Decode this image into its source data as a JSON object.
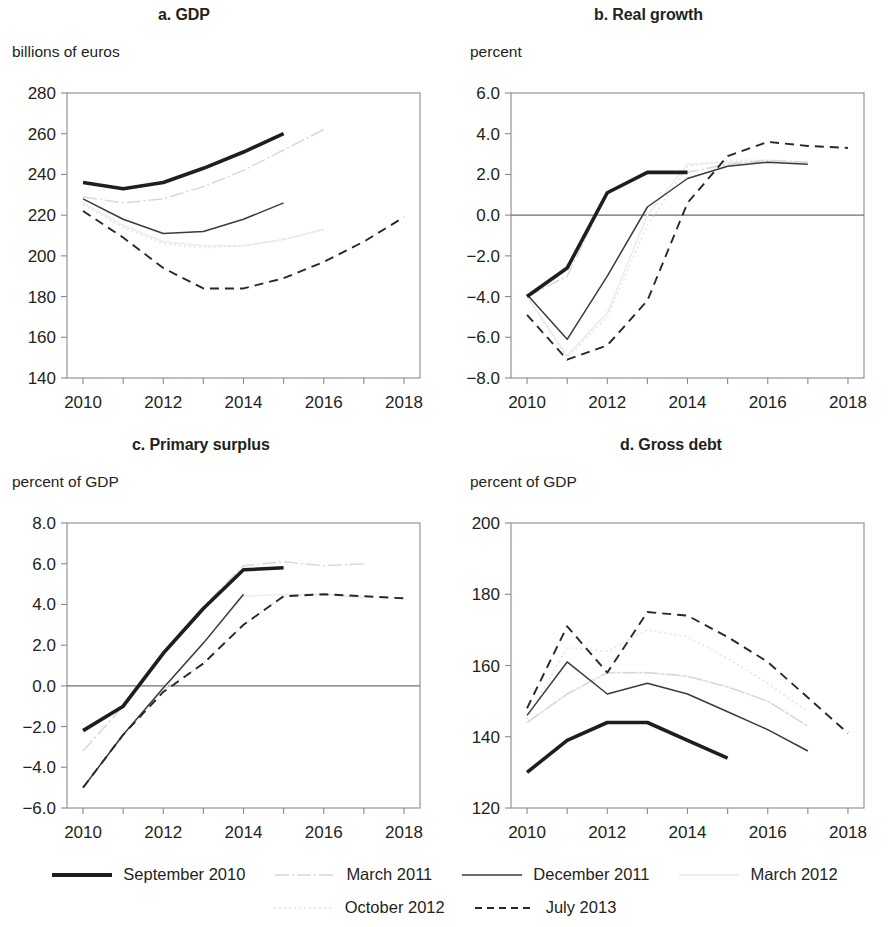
{
  "figure": {
    "panels": [
      {
        "id": "a",
        "title": "a. GDP",
        "unit": "billions of euros"
      },
      {
        "id": "b",
        "title": "b. Real growth",
        "unit": "percent"
      },
      {
        "id": "c",
        "title": "c. Primary surplus",
        "unit": "percent of GDP"
      },
      {
        "id": "d",
        "title": "d. Gross debt",
        "unit": "percent of GDP"
      }
    ]
  },
  "legend": {
    "rows": [
      [
        {
          "label": "September 2010",
          "style": "thick-solid-black",
          "color": "#201d1d"
        },
        {
          "label": "March 2011",
          "style": "light-dash-dot",
          "color": "#d8d8d8"
        },
        {
          "label": "December 2011",
          "style": "thin-solid-gray",
          "color": "#3b3b3b"
        },
        {
          "label": "March 2012",
          "style": "very-light-solid",
          "color": "#ededed"
        }
      ],
      [
        {
          "label": "October 2012",
          "style": "very-light-dotted",
          "color": "#e4e4e4"
        },
        {
          "label": "July 2013",
          "style": "black-dashed",
          "color": "#2a2727"
        }
      ]
    ]
  },
  "chart_data": [
    {
      "type": "line",
      "panel": "a",
      "title": "a. GDP",
      "xlabel": "",
      "ylabel": "billions of euros",
      "ylim": [
        140,
        280
      ],
      "yticks": [
        "140",
        "160",
        "180",
        "200",
        "220",
        "240",
        "260",
        "280"
      ],
      "xlim": [
        2009.6,
        2018.4
      ],
      "xticks": [
        "2010",
        "2011",
        "2012",
        "2013",
        "2014",
        "2015",
        "2016",
        "2017",
        "2018"
      ],
      "xtick_labels_shown": [
        "2010",
        "2012",
        "2014",
        "2016",
        "2018"
      ],
      "grid": false,
      "legend_position": "below figure",
      "series": [
        {
          "name": "September 2010",
          "x": [
            2010,
            2011,
            2012,
            2013,
            2014,
            2015
          ],
          "values": [
            236,
            233,
            236,
            243,
            251,
            260
          ]
        },
        {
          "name": "March 2011",
          "x": [
            2010,
            2011,
            2012,
            2013,
            2014,
            2015,
            2016
          ],
          "values": [
            229,
            226,
            228,
            234,
            242,
            252,
            262
          ]
        },
        {
          "name": "December 2011",
          "x": [
            2010,
            2011,
            2012,
            2013,
            2014,
            2015
          ],
          "values": [
            228,
            218,
            211,
            212,
            218,
            226
          ]
        },
        {
          "name": "March 2012",
          "x": [
            2010,
            2011,
            2012,
            2013,
            2014,
            2015,
            2016
          ],
          "values": [
            226,
            215,
            207,
            205,
            205,
            208,
            213
          ]
        },
        {
          "name": "October 2012",
          "x": [
            2010,
            2011,
            2012,
            2013,
            2014,
            2015,
            2016
          ],
          "values": [
            225,
            214,
            206,
            204,
            205,
            208,
            213
          ]
        },
        {
          "name": "July 2013",
          "x": [
            2010,
            2011,
            2012,
            2013,
            2014,
            2015,
            2016,
            2017,
            2018
          ],
          "values": [
            222,
            209,
            194,
            184,
            184,
            189,
            197,
            207,
            219
          ]
        }
      ]
    },
    {
      "type": "line",
      "panel": "b",
      "title": "b. Real growth",
      "xlabel": "",
      "ylabel": "percent",
      "ylim": [
        -8.0,
        6.0
      ],
      "yticks": [
        "-8.0",
        "-6.0",
        "-4.0",
        "-2.0",
        "0.0",
        "2.0",
        "4.0",
        "6.0"
      ],
      "xlim": [
        2009.6,
        2018.4
      ],
      "xticks": [
        "2010",
        "2011",
        "2012",
        "2013",
        "2014",
        "2015",
        "2016",
        "2017",
        "2018"
      ],
      "xtick_labels_shown": [
        "2010",
        "2012",
        "2014",
        "2016",
        "2018"
      ],
      "grid": false,
      "zero_line": 0.0,
      "legend_position": "below figure",
      "series": [
        {
          "name": "September 2010",
          "x": [
            2010,
            2011,
            2012,
            2013,
            2014
          ],
          "values": [
            -4.0,
            -2.6,
            1.1,
            2.1,
            2.1
          ]
        },
        {
          "name": "March 2011",
          "x": [
            2010,
            2011,
            2012,
            2013,
            2014,
            2015,
            2016,
            2017
          ],
          "values": [
            -4.0,
            -3.0,
            1.1,
            2.1,
            2.1,
            2.5,
            2.7,
            2.6
          ]
        },
        {
          "name": "December 2011",
          "x": [
            2010,
            2011,
            2012,
            2013,
            2014,
            2015,
            2016,
            2017
          ],
          "values": [
            -3.9,
            -6.1,
            -3.0,
            0.4,
            1.8,
            2.4,
            2.6,
            2.5
          ]
        },
        {
          "name": "March 2012",
          "x": [
            2010,
            2011,
            2012,
            2013,
            2014,
            2015,
            2016,
            2017
          ],
          "values": [
            -4.0,
            -6.9,
            -4.8,
            0.0,
            2.5,
            2.6,
            2.6,
            2.6
          ]
        },
        {
          "name": "October 2012",
          "x": [
            2010,
            2011,
            2012,
            2013,
            2014,
            2015,
            2016,
            2017
          ],
          "values": [
            -4.0,
            -7.0,
            -5.0,
            -0.5,
            2.4,
            2.7,
            2.7,
            2.6
          ]
        },
        {
          "name": "July 2013",
          "x": [
            2010,
            2011,
            2012,
            2013,
            2014,
            2015,
            2016,
            2017,
            2018
          ],
          "values": [
            -4.9,
            -7.1,
            -6.4,
            -4.2,
            0.6,
            2.9,
            3.6,
            3.4,
            3.3
          ]
        }
      ]
    },
    {
      "type": "line",
      "panel": "c",
      "title": "c. Primary surplus",
      "xlabel": "",
      "ylabel": "percent of GDP",
      "ylim": [
        -6.0,
        8.0
      ],
      "yticks": [
        "-6.0",
        "-4.0",
        "-2.0",
        "0.0",
        "2.0",
        "4.0",
        "6.0",
        "8.0"
      ],
      "xlim": [
        2009.6,
        2018.4
      ],
      "xticks": [
        "2010",
        "2011",
        "2012",
        "2013",
        "2014",
        "2015",
        "2016",
        "2017",
        "2018"
      ],
      "xtick_labels_shown": [
        "2010",
        "2012",
        "2014",
        "2016",
        "2018"
      ],
      "grid": false,
      "zero_line": 0.0,
      "legend_position": "below figure",
      "series": [
        {
          "name": "September 2010",
          "x": [
            2010,
            2011,
            2012,
            2013,
            2014,
            2015
          ],
          "values": [
            -2.2,
            -1.0,
            1.6,
            3.8,
            5.7,
            5.8
          ]
        },
        {
          "name": "March 2011",
          "x": [
            2010,
            2011,
            2012,
            2013,
            2014,
            2015,
            2016,
            2017
          ],
          "values": [
            -3.2,
            -1.0,
            1.6,
            3.9,
            5.9,
            6.1,
            5.9,
            6.0
          ]
        },
        {
          "name": "December 2011",
          "x": [
            2010,
            2011,
            2012,
            2013,
            2014
          ],
          "values": [
            -5.0,
            -2.4,
            -0.1,
            2.1,
            4.5
          ]
        },
        {
          "name": "March 2012",
          "x": [
            2010,
            2011,
            2012,
            2013,
            2014,
            2015,
            2016,
            2017
          ],
          "values": [
            -5.0,
            -2.4,
            -0.2,
            2.1,
            4.4,
            4.5,
            4.5,
            4.3
          ]
        },
        {
          "name": "October 2012",
          "x": [
            2010,
            2011,
            2012,
            2013,
            2014,
            2015,
            2016,
            2017
          ],
          "values": [
            -5.0,
            -2.4,
            -0.2,
            1.1,
            3.0,
            4.4,
            4.5,
            4.4
          ]
        },
        {
          "name": "July 2013",
          "x": [
            2010,
            2011,
            2012,
            2013,
            2014,
            2015,
            2016,
            2017,
            2018
          ],
          "values": [
            -5.0,
            -2.4,
            -0.3,
            1.1,
            3.0,
            4.4,
            4.5,
            4.4,
            4.3
          ]
        }
      ]
    },
    {
      "type": "line",
      "panel": "d",
      "title": "d. Gross debt",
      "xlabel": "",
      "ylabel": "percent of GDP",
      "ylim": [
        120,
        200
      ],
      "yticks": [
        "120",
        "140",
        "160",
        "180",
        "200"
      ],
      "xlim": [
        2009.6,
        2018.4
      ],
      "xticks": [
        "2010",
        "2011",
        "2012",
        "2013",
        "2014",
        "2015",
        "2016",
        "2017",
        "2018"
      ],
      "xtick_labels_shown": [
        "2010",
        "2012",
        "2014",
        "2016",
        "2018"
      ],
      "grid": false,
      "legend_position": "below figure",
      "series": [
        {
          "name": "September 2010",
          "x": [
            2010,
            2011,
            2012,
            2013,
            2014,
            2015
          ],
          "values": [
            130,
            139,
            144,
            144,
            139,
            134
          ]
        },
        {
          "name": "March 2011",
          "x": [
            2010,
            2011,
            2012,
            2013,
            2014,
            2015,
            2016,
            2017
          ],
          "values": [
            144,
            152,
            158,
            158,
            157,
            154,
            150,
            143
          ]
        },
        {
          "name": "December 2011",
          "x": [
            2010,
            2011,
            2012,
            2013,
            2014,
            2015,
            2016,
            2017
          ],
          "values": [
            146,
            161,
            152,
            155,
            152,
            147,
            142,
            136
          ]
        },
        {
          "name": "March 2012",
          "x": [
            2010,
            2011,
            2012,
            2013,
            2014,
            2015,
            2016,
            2017
          ],
          "values": [
            144,
            152,
            158,
            158,
            157,
            154,
            150,
            143
          ]
        },
        {
          "name": "October 2012",
          "x": [
            2010,
            2011,
            2012,
            2013,
            2014,
            2015,
            2016,
            2017
          ],
          "values": [
            145,
            165,
            164,
            170,
            168,
            162,
            155,
            147
          ]
        },
        {
          "name": "July 2013",
          "x": [
            2010,
            2011,
            2012,
            2013,
            2014,
            2015,
            2016,
            2017,
            2018
          ],
          "values": [
            148,
            171,
            158,
            175,
            174,
            168,
            161,
            151,
            141
          ]
        }
      ]
    }
  ]
}
